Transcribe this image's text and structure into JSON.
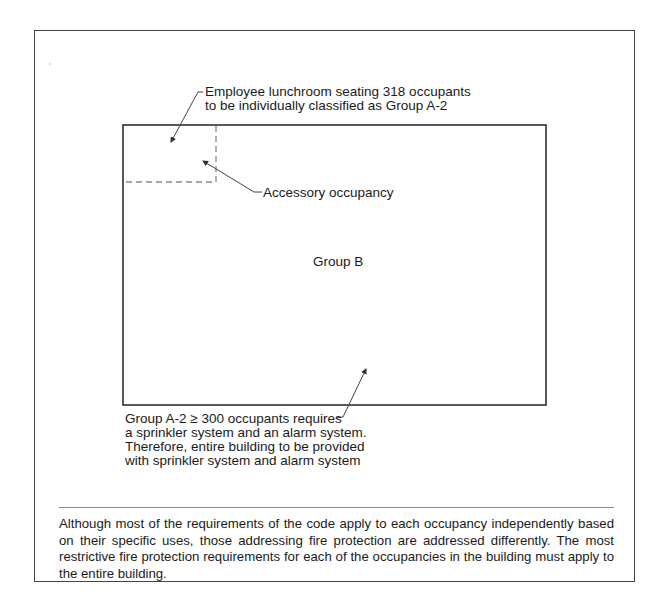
{
  "diagram": {
    "callouts": {
      "lunchroom": {
        "line1": "Employee lunchroom seating 318 occupants",
        "line2": "to be individually classified as Group A-2"
      },
      "accessory": "Accessory occupancy",
      "main_area": "Group B",
      "requirement": {
        "line1": "Group A-2 ≥ 300 occupants requires",
        "line2": "a sprinkler system and an alarm system.",
        "line3": "Therefore, entire building to be provided",
        "line4": "with sprinkler system and alarm system"
      }
    },
    "caption": "Although most of the requirements of the code apply to each occupancy independently based on their specific uses, those addressing fire protection are addressed differently.  The most restrictive fire protection requirements for each of the occupancies in the building must apply to the entire building.",
    "colors": {
      "stroke": "#333333",
      "dashed": "#888888",
      "text": "#1a1a1a"
    }
  }
}
